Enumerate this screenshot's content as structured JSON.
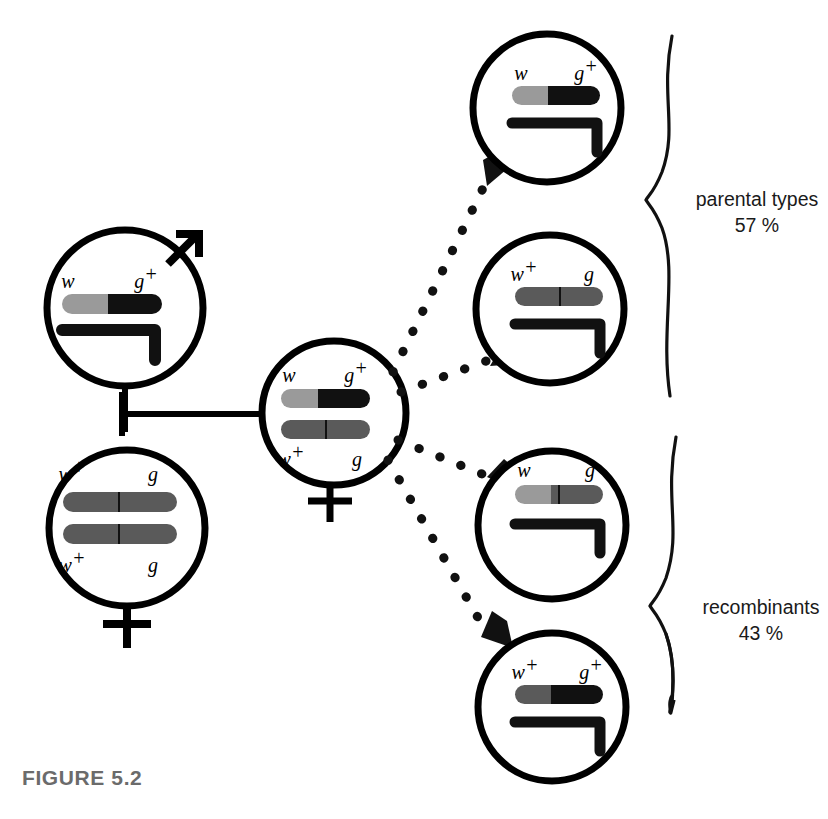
{
  "figure": {
    "caption": "FIGURE 5.2",
    "caption_color": "#6b6b6b",
    "background": "#ffffff"
  },
  "colors": {
    "outline": "#000000",
    "allele_black": "#111111",
    "allele_light_gray": "#9a9a9a",
    "allele_dark_gray": "#5a5a5a",
    "label_text": "#000000",
    "bracket_text": "#1a1a1a"
  },
  "parents": [
    {
      "id": "father",
      "sex": "male",
      "sex_symbol": "mars-arrow",
      "chromosomes": [
        {
          "labels_top": [
            "w",
            "g+"
          ],
          "segments": [
            {
              "allele": "w",
              "shade": "light-gray"
            },
            {
              "allele": "g+",
              "shade": "black"
            }
          ]
        },
        {
          "type": "y-chromosome",
          "shape": "hook"
        }
      ]
    },
    {
      "id": "mother",
      "sex": "female",
      "sex_symbol": "venus-cross",
      "chromosomes": [
        {
          "labels_top": [
            "w+",
            "g"
          ],
          "segments": [
            {
              "allele": "w+",
              "shade": "dark-gray"
            },
            {
              "allele": "g",
              "shade": "dark-gray"
            }
          ]
        },
        {
          "labels_bottom": [
            "w+",
            "g"
          ],
          "segments": [
            {
              "allele": "w+",
              "shade": "dark-gray"
            },
            {
              "allele": "g",
              "shade": "dark-gray"
            }
          ]
        }
      ]
    }
  ],
  "f1": {
    "id": "f1-female",
    "sex": "female",
    "sex_symbol": "venus-cross",
    "chromosomes": [
      {
        "labels_top": [
          "w",
          "g+"
        ],
        "segments": [
          {
            "allele": "w",
            "shade": "light-gray"
          },
          {
            "allele": "g+",
            "shade": "black"
          }
        ]
      },
      {
        "labels_bottom": [
          "w+",
          "g"
        ],
        "segments": [
          {
            "allele": "w+",
            "shade": "dark-gray"
          },
          {
            "allele": "g",
            "shade": "dark-gray"
          }
        ]
      }
    ]
  },
  "offspring": [
    {
      "id": "offspring-1",
      "group": "parental",
      "labels_top": [
        "w",
        "g+"
      ],
      "segments": [
        {
          "allele": "w",
          "shade": "light-gray"
        },
        {
          "allele": "g+",
          "shade": "black"
        }
      ],
      "has_y_chromosome": true
    },
    {
      "id": "offspring-2",
      "group": "parental",
      "labels_top": [
        "w+",
        "g"
      ],
      "segments": [
        {
          "allele": "w+",
          "shade": "dark-gray"
        },
        {
          "allele": "g",
          "shade": "dark-gray"
        }
      ],
      "has_y_chromosome": true
    },
    {
      "id": "offspring-3",
      "group": "recombinant",
      "labels_top": [
        "w",
        "g"
      ],
      "segments": [
        {
          "allele": "w",
          "shade": "light-gray"
        },
        {
          "allele": "g",
          "shade": "dark-gray"
        }
      ],
      "has_y_chromosome": true
    },
    {
      "id": "offspring-4",
      "group": "recombinant",
      "labels_top": [
        "w+",
        "g+"
      ],
      "segments": [
        {
          "allele": "w+",
          "shade": "dark-gray"
        },
        {
          "allele": "g+",
          "shade": "black"
        }
      ],
      "has_y_chromosome": true
    }
  ],
  "brackets": [
    {
      "id": "parental-bracket",
      "label": "parental types",
      "percent": "57 %"
    },
    {
      "id": "recombinant-bracket",
      "label": "recombinants",
      "percent": "43 %"
    }
  ]
}
